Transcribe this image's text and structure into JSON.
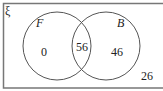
{
  "diagram": {
    "type": "venn",
    "universal_symbol": "ξ",
    "sets": [
      {
        "name": "F",
        "only": "0"
      },
      {
        "name": "B",
        "only": "46"
      }
    ],
    "intersection": "56",
    "outside": "26",
    "colors": {
      "stroke": "#555555",
      "frame": "#777777",
      "text": "#222222",
      "background": "#ffffff"
    }
  }
}
